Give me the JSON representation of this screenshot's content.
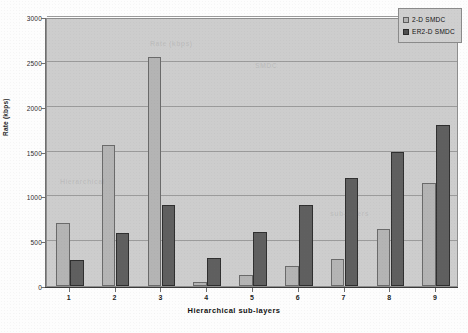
{
  "chart_data": {
    "type": "bar",
    "title": "",
    "xlabel": "Hierarchical sub-layers",
    "ylabel": "Rate (kbps)",
    "categories": [
      "1",
      "2",
      "3",
      "4",
      "5",
      "6",
      "7",
      "8",
      "9"
    ],
    "series": [
      {
        "name": "2-D SMDC",
        "color": "#b4b4b4",
        "values": [
          700,
          1570,
          2550,
          50,
          120,
          220,
          300,
          640,
          1150
        ]
      },
      {
        "name": "ER2-D SMDC",
        "color": "#5f5f5f",
        "values": [
          290,
          590,
          900,
          310,
          600,
          900,
          1200,
          1500,
          1800
        ]
      }
    ],
    "ylim": [
      0,
      3000
    ],
    "ytick_labels": [
      "0",
      "500",
      "1000",
      "1500",
      "2000",
      "2500",
      "3000"
    ],
    "ytick_values": [
      0,
      500,
      1000,
      1500,
      2000,
      2500,
      3000
    ],
    "grid": true,
    "grid_axis": "y",
    "legend_position": "top-right-inside",
    "plot_background": "#cdcdcd",
    "page_background": "#fdfdfd"
  },
  "legend": {
    "entries": [
      {
        "label": "2-D SMDC"
      },
      {
        "label": "ER2-D SMDC"
      }
    ]
  },
  "axes": {
    "y_title": "Rate (kbps)",
    "x_title": "Hierarchical sub-layers"
  },
  "ghost_text": {
    "g1": "Rate (kbps)",
    "g2": "SMDC",
    "g3": "Hierarchical",
    "g4": "sub-layers"
  }
}
